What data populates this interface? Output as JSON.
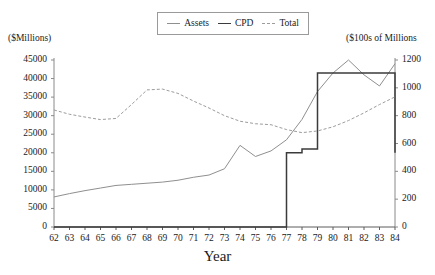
{
  "chart_data": {
    "type": "line",
    "title": "",
    "xlabel": "Year",
    "ylabel": "($Millions)",
    "y2label": "($100s of Millions",
    "grid": false,
    "legend_position": "top-center",
    "x": [
      62,
      63,
      64,
      65,
      66,
      67,
      68,
      69,
      70,
      71,
      72,
      73,
      74,
      75,
      76,
      77,
      78,
      79,
      80,
      81,
      82,
      83,
      84
    ],
    "categories": [
      "62",
      "63",
      "64",
      "65",
      "66",
      "67",
      "68",
      "69",
      "70",
      "71",
      "72",
      "73",
      "74",
      "75",
      "76",
      "77",
      "78",
      "79",
      "80",
      "81",
      "82",
      "83",
      "84"
    ],
    "ylim": [
      0,
      45000
    ],
    "yticks": [
      0,
      5000,
      10000,
      15000,
      20000,
      25000,
      30000,
      35000,
      40000,
      45000
    ],
    "y2lim": [
      0,
      1200
    ],
    "y2ticks": [
      0,
      200,
      400,
      600,
      800,
      1000,
      1200
    ],
    "series": [
      {
        "name": "Assets",
        "axis": "left",
        "style": "solid-light",
        "color": "#8f8f8f",
        "values": [
          8100,
          9000,
          9800,
          10500,
          11200,
          11500,
          11800,
          12100,
          12600,
          13400,
          14000,
          15700,
          22000,
          19000,
          20500,
          23500,
          29000,
          36500,
          41500,
          45000,
          41000,
          38000,
          44000
        ]
      },
      {
        "name": "CPD",
        "axis": "left",
        "style": "solid-dark-step",
        "color": "#3b3b3b",
        "values": [
          0,
          0,
          0,
          0,
          0,
          0,
          0,
          0,
          0,
          0,
          0,
          0,
          0,
          0,
          0,
          20000,
          21000,
          41500,
          41500,
          41500,
          41500,
          41500,
          20000
        ]
      },
      {
        "name": "Total",
        "axis": "right",
        "style": "dashed",
        "color": "#9c9c9c",
        "values": [
          841,
          810,
          790,
          772,
          780,
          880,
          985,
          991,
          960,
          905,
          855,
          800,
          760,
          742,
          735,
          700,
          678,
          690,
          720,
          765,
          820,
          880,
          935
        ]
      }
    ]
  },
  "legend": {
    "items": [
      {
        "label": "Assets",
        "key": "assets"
      },
      {
        "label": "CPD",
        "key": "cpd"
      },
      {
        "label": "Total",
        "key": "total"
      }
    ]
  },
  "axes": {
    "left_unit": "($Millions)",
    "right_unit": "($100s of Millions",
    "x_title": "Year",
    "left_ticks": [
      "45000",
      "40000",
      "35000",
      "30000",
      "25000",
      "20000",
      "15000",
      "10000",
      "5000",
      "0"
    ],
    "right_ticks": [
      "1200",
      "1000",
      "800",
      "600",
      "400",
      "200",
      "0"
    ],
    "x_ticks": [
      "62",
      "63",
      "64",
      "65",
      "66",
      "67",
      "68",
      "69",
      "70",
      "71",
      "72",
      "73",
      "74",
      "75",
      "76",
      "77",
      "78",
      "79",
      "80",
      "81",
      "82",
      "83",
      "84"
    ]
  },
  "colors": {
    "assets": "#8f8f8f",
    "cpd": "#3b3b3b",
    "total": "#9c9c9c",
    "axis": "#8a8a8a",
    "text": "#1a1a1a"
  }
}
